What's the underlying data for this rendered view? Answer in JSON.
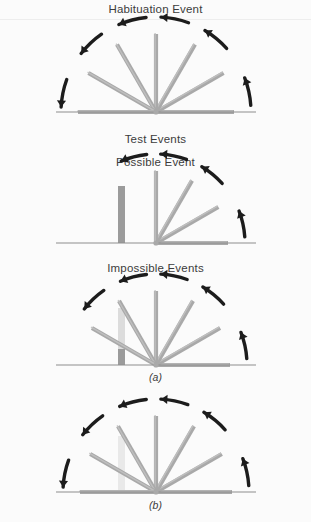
{
  "figure": {
    "title": "Habituation Event",
    "headings": {
      "test_events": "Test Events",
      "possible_event": "Possible Event",
      "impossible_events": "Impossible Events"
    },
    "panel_labels": {
      "a": "(a)",
      "b": "(b)"
    }
  },
  "colors": {
    "background": "#fbfbfb",
    "rule": "#ededed",
    "arm": "#a9a9a9",
    "arm_edge": "#8b8b8b",
    "arm_highlight": "#c2c2c2",
    "baseline": "#8e8e8e",
    "arrow": "#1c1c1c",
    "text": "#3c3c3c",
    "box_solid": "#9b9b9b",
    "box_ghost": "#dcdcdc",
    "box_ghost_light": "#e9e9e9"
  },
  "panels": [
    {
      "id": "habituation",
      "name": "habituation-event-fan",
      "caption": "Habituation Event",
      "pivot": {
        "x": 156,
        "y": 112
      },
      "baseline": {
        "x1": 56,
        "x2": 256,
        "y": 112
      },
      "arm_length": 78,
      "arm_angles_deg": [
        0,
        30,
        60,
        90,
        120,
        150,
        180
      ],
      "sweep_description": "screen rotates through full 180 degrees",
      "arrows": [
        {
          "name": "rotation-arrow-right-low",
          "angle_deg": 12
        },
        {
          "name": "rotation-arrow-right-mid",
          "angle_deg": 50
        },
        {
          "name": "rotation-arrow-top-right",
          "angle_deg": 78
        },
        {
          "name": "rotation-arrow-top-left",
          "angle_deg": 104
        },
        {
          "name": "rotation-arrow-left-mid",
          "angle_deg": 133
        },
        {
          "name": "rotation-arrow-left-low",
          "angle_deg": 168
        }
      ],
      "box": null
    },
    {
      "id": "possible",
      "name": "possible-event-fan",
      "caption": "Possible Event",
      "pivot": {
        "x": 156,
        "y": 243
      },
      "baseline": {
        "x1": 56,
        "x2": 256,
        "y": 243
      },
      "arm_length": 72,
      "arm_angles_deg": [
        0,
        30,
        60,
        90
      ],
      "sweep_description": "screen stops at vertical, blocked by object",
      "arrows": [
        {
          "name": "rotation-arrow-right-low",
          "angle_deg": 12
        },
        {
          "name": "rotation-arrow-right-mid",
          "angle_deg": 50
        },
        {
          "name": "rotation-arrow-top-right",
          "angle_deg": 78
        },
        {
          "name": "rotation-arrow-top-left",
          "angle_deg": 104
        }
      ],
      "box": {
        "name": "solid-object-box",
        "x": 118,
        "top": 186,
        "width": 7,
        "height": 57,
        "fill": "#9b9b9b"
      }
    },
    {
      "id": "impossible-a",
      "name": "impossible-event-a-fan",
      "caption": "(a)",
      "pivot": {
        "x": 156,
        "y": 365
      },
      "baseline": {
        "x1": 56,
        "x2": 256,
        "y": 365
      },
      "arm_length": 74,
      "arm_angles_deg": [
        0,
        30,
        60,
        90,
        120,
        150
      ],
      "sweep_description": "screen rotates through the object to 150 degrees",
      "arrows": [
        {
          "name": "rotation-arrow-right-low",
          "angle_deg": 12
        },
        {
          "name": "rotation-arrow-right-mid",
          "angle_deg": 50
        },
        {
          "name": "rotation-arrow-top-right",
          "angle_deg": 78
        },
        {
          "name": "rotation-arrow-top-left",
          "angle_deg": 104
        },
        {
          "name": "rotation-arrow-left-mid",
          "angle_deg": 133
        }
      ],
      "box": {
        "name": "ghost-object-box",
        "x": 118,
        "top": 308,
        "width": 7,
        "height": 57,
        "fill": "#dcdcdc",
        "foot_fill": "#9b9b9b",
        "foot_height": 16
      }
    },
    {
      "id": "impossible-b",
      "name": "impossible-event-b-fan",
      "caption": "(b)",
      "pivot": {
        "x": 156,
        "y": 492
      },
      "baseline": {
        "x1": 56,
        "x2": 256,
        "y": 492
      },
      "arm_length": 76,
      "arm_angles_deg": [
        0,
        30,
        60,
        90,
        120,
        150,
        180
      ],
      "sweep_description": "screen rotates a full 180 degrees through the object",
      "arrows": [
        {
          "name": "rotation-arrow-right-low",
          "angle_deg": 12
        },
        {
          "name": "rotation-arrow-right-mid",
          "angle_deg": 50
        },
        {
          "name": "rotation-arrow-top-right",
          "angle_deg": 78
        },
        {
          "name": "rotation-arrow-top-left",
          "angle_deg": 104
        },
        {
          "name": "rotation-arrow-left-mid",
          "angle_deg": 133
        },
        {
          "name": "rotation-arrow-left-low",
          "angle_deg": 168
        }
      ],
      "box": {
        "name": "ghost-object-box",
        "x": 118,
        "top": 436,
        "width": 7,
        "height": 56,
        "fill": "#e9e9e9"
      }
    }
  ]
}
